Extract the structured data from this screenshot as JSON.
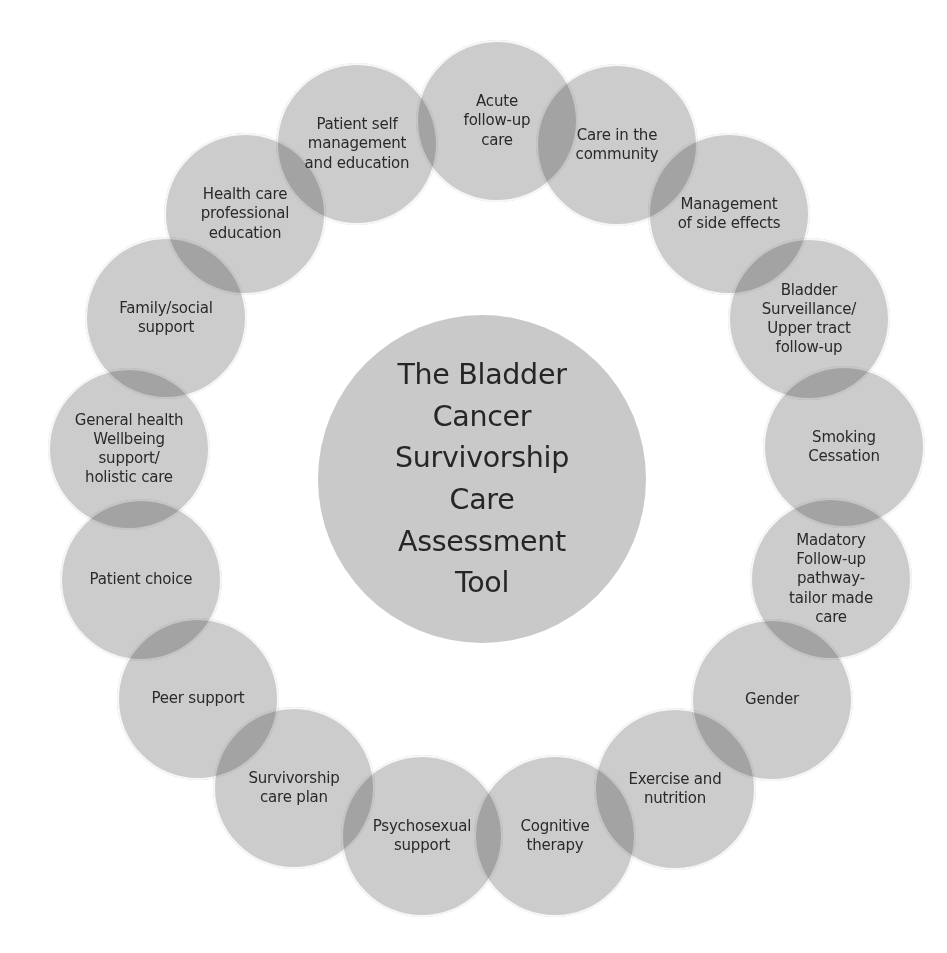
{
  "diagram": {
    "title": "The Bladder\nCancer\nSurvivorship\nCare\nAssessment\nTool",
    "colors": {
      "background": "#ffffff",
      "circle_fill": "#cbcbcb",
      "circle_overlap": "#b0b0b0",
      "circle_stroke": "#ffffff",
      "text": "#2a2a2a"
    },
    "center": {
      "x": 318,
      "y": 315,
      "diameter": 328
    },
    "nodes": [
      {
        "id": "acute-follow-up-care",
        "label": "Acute\nfollow-up\ncare",
        "x": 416,
        "y": 40
      },
      {
        "id": "care-in-the-community",
        "label": "Care in the\ncommunity",
        "x": 536,
        "y": 64
      },
      {
        "id": "management-of-side-effects",
        "label": "Management\nof side effects",
        "x": 648,
        "y": 133
      },
      {
        "id": "bladder-surveillance",
        "label": "Bladder\nSurveillance/\nUpper tract\nfollow-up",
        "x": 728,
        "y": 238
      },
      {
        "id": "smoking-cessation",
        "label": "Smoking\nCessation",
        "x": 763,
        "y": 366
      },
      {
        "id": "mandatory-follow-up",
        "label": "Madatory\nFollow-up\npathway-\ntailor made\ncare",
        "x": 750,
        "y": 498
      },
      {
        "id": "gender",
        "label": "Gender",
        "x": 691,
        "y": 619
      },
      {
        "id": "exercise-and-nutrition",
        "label": "Exercise and\nnutrition",
        "x": 594,
        "y": 708
      },
      {
        "id": "cognitive-therapy",
        "label": "Cognitive\ntherapy",
        "x": 474,
        "y": 755
      },
      {
        "id": "psychosexual-support",
        "label": "Psychosexual\nsupport",
        "x": 341,
        "y": 755
      },
      {
        "id": "survivorship-care-plan",
        "label": "Survivorship\ncare plan",
        "x": 213,
        "y": 707
      },
      {
        "id": "peer-support",
        "label": "Peer support",
        "x": 117,
        "y": 618
      },
      {
        "id": "patient-choice",
        "label": "Patient choice",
        "x": 60,
        "y": 499
      },
      {
        "id": "general-health-wellbeing",
        "label": "General health\nWellbeing\nsupport/\nholistic care",
        "x": 48,
        "y": 368
      },
      {
        "id": "family-social-support",
        "label": "Family/social\nsupport",
        "x": 85,
        "y": 237
      },
      {
        "id": "health-care-professional-education",
        "label": "Health care\nprofessional\neducation",
        "x": 164,
        "y": 133
      },
      {
        "id": "patient-self-management",
        "label": "Patient self\nmanagement\nand education",
        "x": 276,
        "y": 63
      }
    ]
  }
}
